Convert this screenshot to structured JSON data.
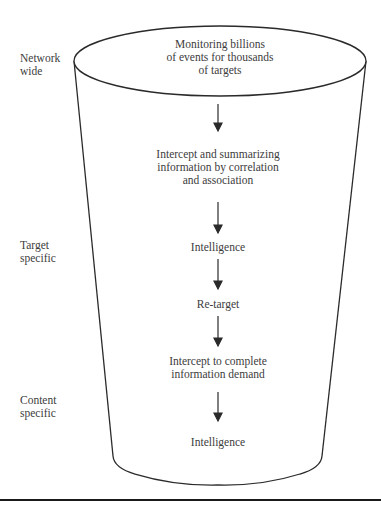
{
  "side_labels": {
    "network": [
      "Network",
      "wide"
    ],
    "target": [
      "Target",
      "specific"
    ],
    "content": [
      "Content",
      "specific"
    ]
  },
  "funnel": {
    "top_text": [
      "Monitoring billions",
      "of events for thousands",
      "of targets"
    ],
    "step1": [
      "Intercept and summarizing",
      "information by correlation",
      "and association"
    ],
    "step2": "Intelligence",
    "step3": "Re-target",
    "step4": [
      "Intercept to complete",
      "information demand"
    ],
    "step5": "Intelligence"
  },
  "arrows": [
    {
      "from": "top_text",
      "to": "step1"
    },
    {
      "from": "step1",
      "to": "step2"
    },
    {
      "from": "step2",
      "to": "step3"
    },
    {
      "from": "step3",
      "to": "step4"
    },
    {
      "from": "step4",
      "to": "step5"
    }
  ],
  "colors": {
    "line": "#2a2a2a",
    "text": "#3c3c3c",
    "rule": "#1a1a1a"
  }
}
